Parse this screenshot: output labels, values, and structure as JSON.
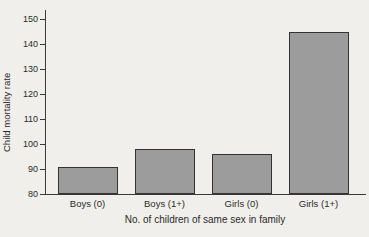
{
  "figure": {
    "background_color": "#f1efeb",
    "bar_fill_color": "#9c9c9c",
    "bar_border_color": "#333333",
    "axis_color": "#3a3a3a",
    "text_color": "#2a2a2a"
  },
  "chart_data": {
    "type": "bar",
    "title": "",
    "categories": [
      "Boys (0)",
      "Boys (1+)",
      "Girls (0)",
      "Girls (1+)"
    ],
    "values": [
      91,
      98,
      96,
      145
    ],
    "xlabel": "No. of children of same sex in family",
    "ylabel": "Child mortality rate",
    "ylim": [
      80,
      150
    ],
    "yticks": [
      80,
      90,
      100,
      110,
      120,
      130,
      140,
      150
    ],
    "grid": false,
    "legend_position": "none"
  }
}
